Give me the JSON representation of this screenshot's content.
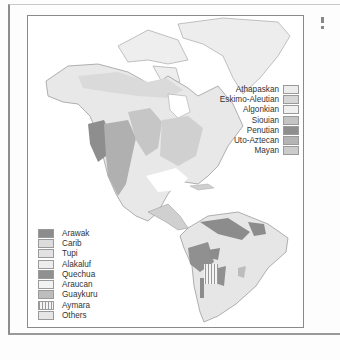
{
  "map": {
    "subject": "Native American language families",
    "colors": {
      "land_base": "#e9e9e9",
      "ocean": "#ffffff",
      "border_lines": "#8a8a8a"
    }
  },
  "legend_north_america": {
    "items": [
      {
        "label": "Athapaskan",
        "color": "#ececec",
        "pattern": "solid"
      },
      {
        "label": "Eskimo-Aleutian",
        "color": "#d6d6d6",
        "pattern": "solid"
      },
      {
        "label": "Algonkian",
        "color": "#f0f0f0",
        "pattern": "solid"
      },
      {
        "label": "Siouian",
        "color": "#c4c4c4",
        "pattern": "solid"
      },
      {
        "label": "Penutian",
        "color": "#8e8e8e",
        "pattern": "solid"
      },
      {
        "label": "Uto-Aztecan",
        "color": "#b4b4b4",
        "pattern": "solid"
      },
      {
        "label": "Mayan",
        "color": "#cbcbcb",
        "pattern": "solid"
      }
    ]
  },
  "legend_south_america": {
    "items": [
      {
        "label": "Arawak",
        "color": "#8c8c8c",
        "pattern": "solid"
      },
      {
        "label": "Carib",
        "color": "#dcdcdc",
        "pattern": "solid"
      },
      {
        "label": "Tupi",
        "color": "#e2e2e2",
        "pattern": "solid"
      },
      {
        "label": "Alakaluf",
        "color": "#ededed",
        "pattern": "dots"
      },
      {
        "label": "Quechua",
        "color": "#909090",
        "pattern": "solid"
      },
      {
        "label": "Araucan",
        "color": "#f2f2f2",
        "pattern": "solid"
      },
      {
        "label": "Guaykuru",
        "color": "#bdbdbd",
        "pattern": "solid"
      },
      {
        "label": "Aymara",
        "color": "#f4f4f4",
        "pattern": "stripes"
      },
      {
        "label": "Others",
        "color": "#e6e6e6",
        "pattern": "solid"
      }
    ]
  }
}
